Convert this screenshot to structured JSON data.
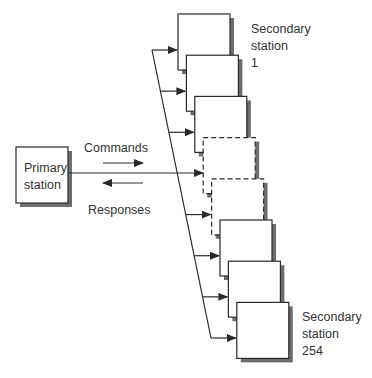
{
  "diagram": {
    "colors": {
      "line": "#2a2a2a",
      "shadow": "#6e6e6e",
      "text": "#333333",
      "box_fill": "#ffffff"
    },
    "primary": {
      "label_line1": "Primary",
      "label_line2": "station"
    },
    "flows": {
      "commands": "Commands",
      "responses": "Responses"
    },
    "secondary_first": {
      "line1": "Secondary",
      "line2": "station",
      "line3": "1"
    },
    "secondary_last": {
      "line1": "Secondary",
      "line2": "station",
      "line3": "254"
    },
    "secondary_stations": [
      {
        "index": 1,
        "style": "solid"
      },
      {
        "index": 2,
        "style": "solid"
      },
      {
        "index": 3,
        "style": "solid"
      },
      {
        "index": 4,
        "style": "dashed"
      },
      {
        "index": 5,
        "style": "dashed"
      },
      {
        "index": 6,
        "style": "solid"
      },
      {
        "index": 7,
        "style": "solid"
      },
      {
        "index": 8,
        "style": "solid"
      }
    ]
  }
}
